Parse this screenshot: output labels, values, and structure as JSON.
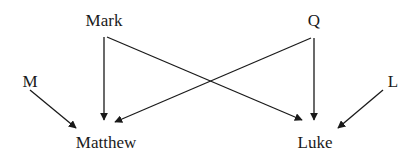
{
  "diagram": {
    "type": "directed-graph",
    "colors": {
      "background": "#ffffff",
      "edge": "#1a1a1a",
      "text": "#1a1a1a"
    },
    "nodes": [
      {
        "id": "mark",
        "label": "Mark",
        "x": 104,
        "y": 20
      },
      {
        "id": "q",
        "label": "Q",
        "x": 314,
        "y": 20
      },
      {
        "id": "m",
        "label": "M",
        "x": 30,
        "y": 81
      },
      {
        "id": "l",
        "label": "L",
        "x": 393,
        "y": 81
      },
      {
        "id": "matthew",
        "label": "Matthew",
        "x": 106,
        "y": 142
      },
      {
        "id": "luke",
        "label": "Luke",
        "x": 315,
        "y": 142
      }
    ],
    "edges": [
      {
        "from": "mark",
        "to": "matthew",
        "x1": 104,
        "y1": 37,
        "x2": 104,
        "y2": 120
      },
      {
        "from": "mark",
        "to": "luke",
        "x1": 107,
        "y1": 37,
        "x2": 302,
        "y2": 120
      },
      {
        "from": "q",
        "to": "luke",
        "x1": 314,
        "y1": 38,
        "x2": 314,
        "y2": 120
      },
      {
        "from": "q",
        "to": "matthew",
        "x1": 311,
        "y1": 38,
        "x2": 115,
        "y2": 122
      },
      {
        "from": "m",
        "to": "matthew",
        "x1": 30,
        "y1": 90,
        "x2": 76,
        "y2": 128
      },
      {
        "from": "l",
        "to": "luke",
        "x1": 383,
        "y1": 90,
        "x2": 338,
        "y2": 128
      }
    ]
  }
}
